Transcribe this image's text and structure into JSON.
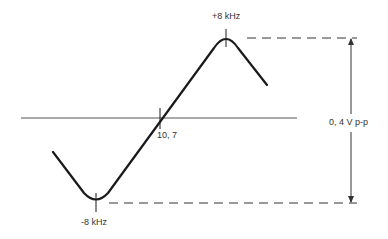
{
  "diagram": {
    "type": "frequency-discriminator-s-curve",
    "labels": {
      "top_peak": "+8 kHz",
      "bottom_peak": "-8 kHz",
      "center": "10, 7",
      "amplitude": "0, 4 V p-p"
    },
    "colors": {
      "curve": "#1a1a1a",
      "axis": "#555555",
      "dashed": "#333333",
      "text": "#333333",
      "background": "#ffffff"
    }
  }
}
